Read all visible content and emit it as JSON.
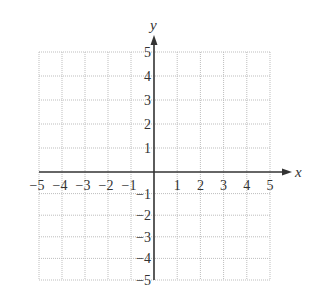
{
  "chart_data": {
    "type": "scatter",
    "title": "",
    "xlabel": "x",
    "ylabel": "y",
    "xlim": [
      -5,
      5
    ],
    "ylim": [
      -5,
      5
    ],
    "grid": true,
    "grid_style": "dotted",
    "x_ticks": [
      -5,
      -4,
      -3,
      -2,
      -1,
      1,
      2,
      3,
      4,
      5
    ],
    "y_ticks": [
      5,
      4,
      3,
      2,
      1,
      -1,
      -2,
      -3,
      -4,
      -5
    ],
    "x_tick_labels": [
      "−5",
      "−4",
      "−3",
      "−2",
      "−1",
      "1",
      "2",
      "3",
      "4",
      "5"
    ],
    "y_tick_labels": [
      "5",
      "4",
      "3",
      "2",
      "1",
      "−1",
      "−2",
      "−3",
      "−4",
      "−5"
    ],
    "series": [],
    "legend": null
  },
  "colors": {
    "axis": "#333333",
    "grid": "#bdbdbd",
    "background": "#ffffff"
  },
  "layout": {
    "x0": 39,
    "x1": 270,
    "y0": 52,
    "y1": 280,
    "origin_x": 154,
    "origin_y": 172
  }
}
